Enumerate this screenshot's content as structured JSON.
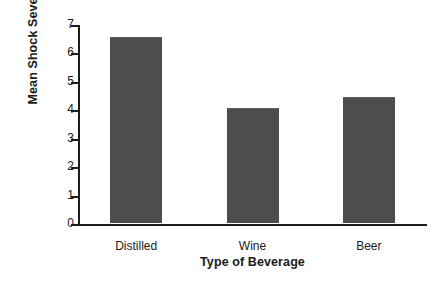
{
  "chart_data": {
    "type": "bar",
    "title": "",
    "subtitle": "",
    "categories": [
      "Distilled",
      "Wine",
      "Beer"
    ],
    "values": [
      6.5,
      4.0,
      4.4
    ],
    "xlabel": "Type of Beverage",
    "ylabel": "Mean Shock Severity",
    "ylim": [
      0,
      7
    ],
    "yticks": [
      "0",
      "1",
      "2",
      "3",
      "4",
      "5",
      "6",
      "7"
    ],
    "ytick_values": [
      0,
      1,
      2,
      3,
      4,
      5,
      6,
      7
    ],
    "grid": false,
    "legend": false,
    "legend_position": "none",
    "bar_color": "#4d4d4d",
    "axis_color": "#1c1c1c",
    "background_color": "#ffffff"
  }
}
